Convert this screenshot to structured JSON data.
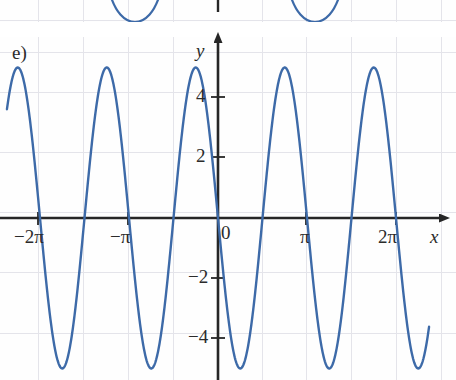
{
  "figure": {
    "part_label": "e)",
    "axis_labels": {
      "x": "x",
      "y": "y"
    },
    "origin_label": "0"
  },
  "chart_data": {
    "type": "line",
    "title": "",
    "subtitle": "",
    "xlabel": "x",
    "ylabel": "y",
    "xlim": [
      -6.9,
      7.4
    ],
    "ylim": [
      -6.3,
      5.9
    ],
    "grid": true,
    "legend": "none",
    "x_ticks": [
      {
        "value": -6.2832,
        "label": "−2π"
      },
      {
        "value": -3.1416,
        "label": "−π"
      },
      {
        "value": 3.1416,
        "label": "π"
      },
      {
        "value": 6.2832,
        "label": "2π"
      }
    ],
    "y_ticks": [
      {
        "value": 4,
        "label": "4"
      },
      {
        "value": 2,
        "label": "2"
      },
      {
        "value": -2,
        "label": "−2"
      },
      {
        "value": -4,
        "label": "−4"
      }
    ],
    "series": [
      {
        "name": "main-curve",
        "color": "#3d6aa8",
        "function": "y = -5*sin(2x)",
        "amplitude": 5,
        "period": 3.1416,
        "phase": 0,
        "vertical_shift": 0,
        "x": [
          -6.9,
          -6.5,
          -6.0,
          -5.5,
          -5.0,
          -4.5,
          -4.0,
          -3.5,
          -3.1416,
          -3.0,
          -2.5,
          -2.0,
          -1.5708,
          -1.5,
          -1.0,
          -0.5,
          0.0,
          0.5,
          1.0,
          1.5708,
          2.0,
          2.5,
          3.1416,
          3.5,
          4.0,
          4.5,
          4.7124,
          5.0,
          5.5,
          6.0,
          6.2832,
          6.5,
          7.0,
          7.4
        ],
        "y": [
          5.9,
          4.6,
          1.4,
          -2.4,
          -4.6,
          -4.1,
          -0.99,
          3.5,
          5.0,
          4.9,
          0.48,
          -3.78,
          -5.0,
          -4.98,
          -0.09,
          4.2,
          0.0,
          -4.2,
          0.09,
          5.0,
          3.78,
          -0.48,
          0.0,
          -3.5,
          0.99,
          4.1,
          5.0,
          4.6,
          -1.4,
          -4.6,
          0.0,
          -2.4,
          4.4,
          4.9
        ]
      },
      {
        "name": "previous-figure-curve-fragment",
        "color": "#3d6aa8",
        "note": "clipped bottom of the sub-figure above"
      }
    ]
  }
}
